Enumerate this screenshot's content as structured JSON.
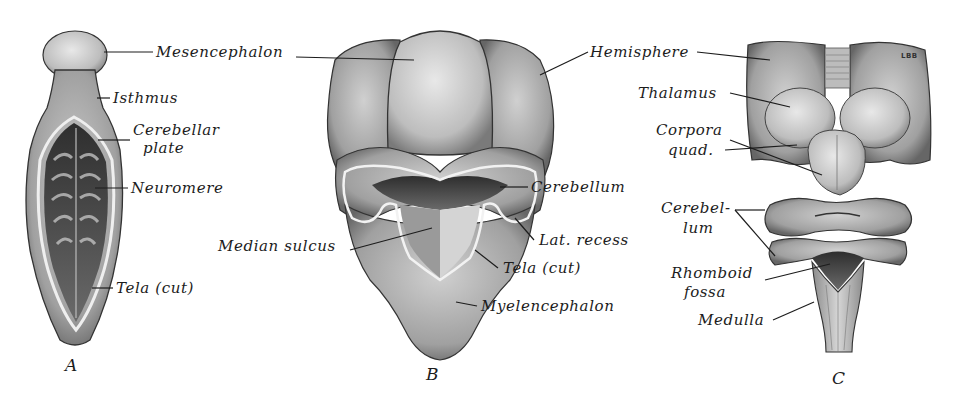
{
  "figures": [
    {
      "id": "A",
      "letter": "A",
      "labels": {
        "mesencephalon": "Mesencephalon",
        "isthmus": "Isthmus",
        "cerebellar_plate_1": "Cerebellar",
        "cerebellar_plate_2": "plate",
        "neuromere": "Neuromere",
        "tela_cut": "Tela (cut)"
      }
    },
    {
      "id": "B",
      "letter": "B",
      "labels": {
        "hemisphere": "Hemisphere",
        "cerebellum": "Cerebellum",
        "median_sulcus": "Median sulcus",
        "lat_recess": "Lat. recess",
        "tela_cut": "Tela (cut)",
        "myelencephalon": "Myelencephalon"
      }
    },
    {
      "id": "C",
      "letter": "C",
      "mark": "LBB",
      "labels": {
        "thalamus": "Thalamus",
        "corpora_quad_1": "Corpora",
        "corpora_quad_2": "quad.",
        "cerebellum_1": "Cerebel-",
        "cerebellum_2": "lum",
        "rhomboid_fossa_1": "Rhomboid",
        "rhomboid_fossa_2": "fossa",
        "medulla": "Medulla"
      }
    }
  ],
  "colors": {
    "background": "#ffffff",
    "ink": "#1c1c1c",
    "tissue_light": "#d9d9d9",
    "tissue_mid": "#a8a8a8",
    "tissue_dark": "#4a4a4a"
  }
}
